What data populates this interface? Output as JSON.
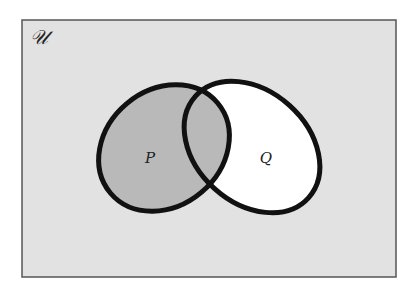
{
  "diagram": {
    "type": "venn",
    "universe": {
      "label": "𝒰",
      "fill": "#e2e2e2",
      "border": "#555555"
    },
    "sets": [
      {
        "name": "P",
        "label": "P",
        "fill": "#b9b9b9",
        "shaded": true
      },
      {
        "name": "Q",
        "label": "Q",
        "fill": "#ffffff",
        "shaded": false
      }
    ],
    "shaded_region": "P",
    "outline_color": "#111111"
  }
}
